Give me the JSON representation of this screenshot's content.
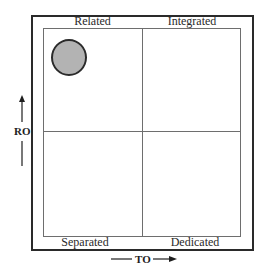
{
  "diagram": {
    "type": "2x2 quadrant matrix",
    "quadrants": {
      "top_left": "Related",
      "top_right": "Integrated",
      "bottom_left": "Separated",
      "bottom_right": "Dedicated"
    },
    "axes": {
      "vertical": {
        "label": "RO",
        "direction": "up"
      },
      "horizontal": {
        "label": "TO",
        "direction": "right"
      }
    },
    "marker": {
      "shape": "circle",
      "quadrant": "top_left",
      "fill": "#b3b3b3",
      "stroke": "#2b2b2b"
    }
  },
  "colors": {
    "outer_border": "#2a2a2a",
    "inner_lines": "#6e6e6e",
    "text": "#2a2a2a"
  }
}
